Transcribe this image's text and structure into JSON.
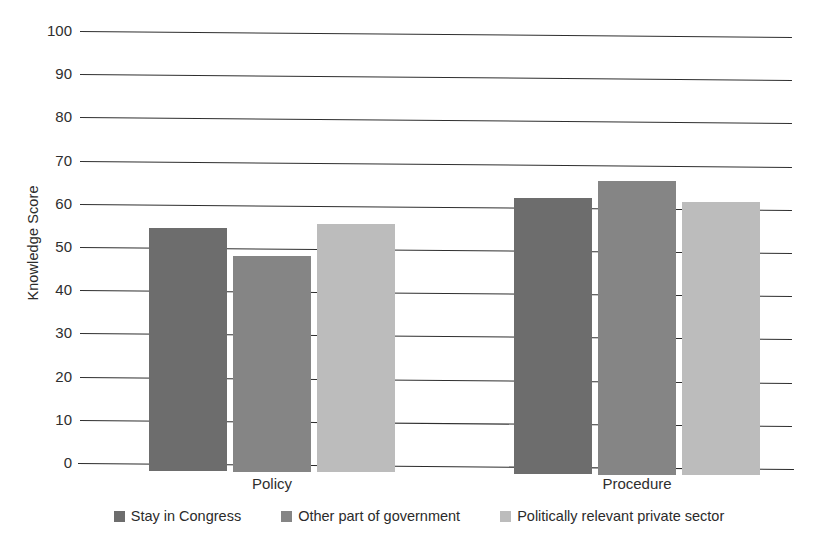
{
  "chart_data": {
    "type": "bar",
    "title": "",
    "xlabel": "",
    "ylabel": "Knowledge Score",
    "ylim": [
      0,
      100
    ],
    "ytick_step": 10,
    "grid": true,
    "legend_position": "bottom",
    "categories": [
      "Policy",
      "Procedure"
    ],
    "series": [
      {
        "name": "Stay in Congress",
        "color": "#6d6d6d",
        "values": [
          56,
          63
        ]
      },
      {
        "name": "Other part of government",
        "color": "#858585",
        "values": [
          49.5,
          67
        ]
      },
      {
        "name": "Politically relevant private sector",
        "color": "#bcbcbc",
        "values": [
          57,
          62
        ]
      }
    ],
    "ytick_labels": [
      "100",
      "90",
      "80",
      "70",
      "60",
      "50",
      "40",
      "30",
      "20",
      "10",
      "0"
    ]
  },
  "axis": {
    "y_title": "Knowledge Score",
    "ticks": [
      {
        "label": "100",
        "value": 100
      },
      {
        "label": "90",
        "value": 90
      },
      {
        "label": "80",
        "value": 80
      },
      {
        "label": "70",
        "value": 70
      },
      {
        "label": "60",
        "value": 60
      },
      {
        "label": "50",
        "value": 50
      },
      {
        "label": "40",
        "value": 40
      },
      {
        "label": "30",
        "value": 30
      },
      {
        "label": "20",
        "value": 20
      },
      {
        "label": "10",
        "value": 10
      },
      {
        "label": "0",
        "value": 0
      }
    ]
  },
  "categories": [
    {
      "label": "Policy"
    },
    {
      "label": "Procedure"
    }
  ],
  "legend": {
    "items": [
      {
        "label": "Stay in Congress",
        "color": "#6d6d6d"
      },
      {
        "label": "Other part of government",
        "color": "#858585"
      },
      {
        "label": "Politically relevant private sector",
        "color": "#bcbcbc"
      }
    ]
  }
}
